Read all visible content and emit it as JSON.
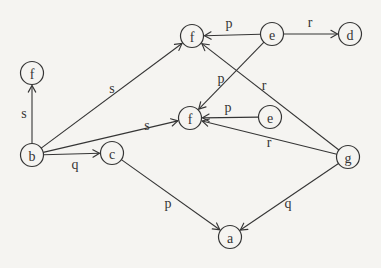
{
  "page": {
    "background_color": "#f5f4f1",
    "ink_color": "#353535"
  },
  "diagram": {
    "type": "directed-graph",
    "node_radius": 11.5,
    "nodes": [
      {
        "id": "f-top",
        "label": "f",
        "x": 192,
        "y": 36
      },
      {
        "id": "e-top",
        "label": "e",
        "x": 272,
        "y": 34
      },
      {
        "id": "d",
        "label": "d",
        "x": 350,
        "y": 34
      },
      {
        "id": "f-left",
        "label": "f",
        "x": 32,
        "y": 73
      },
      {
        "id": "f-mid",
        "label": "f",
        "x": 190,
        "y": 118
      },
      {
        "id": "e-mid",
        "label": "e",
        "x": 270,
        "y": 117
      },
      {
        "id": "b",
        "label": "b",
        "x": 32,
        "y": 155
      },
      {
        "id": "c",
        "label": "c",
        "x": 112,
        "y": 153
      },
      {
        "id": "g",
        "label": "g",
        "x": 348,
        "y": 157
      },
      {
        "id": "a",
        "label": "a",
        "x": 230,
        "y": 237
      }
    ],
    "edges": [
      {
        "from": "b",
        "to": "f-left",
        "label": "s",
        "label_x": 24,
        "label_y": 113
      },
      {
        "from": "b",
        "to": "f-top",
        "label": "s",
        "label_x": 112,
        "label_y": 88
      },
      {
        "from": "b",
        "to": "f-mid",
        "label": "s",
        "label_x": 147,
        "label_y": 125
      },
      {
        "from": "b",
        "to": "c",
        "label": "q",
        "label_x": 75,
        "label_y": 164
      },
      {
        "from": "e-top",
        "to": "f-top",
        "label": "p",
        "label_x": 229,
        "label_y": 23
      },
      {
        "from": "e-top",
        "to": "d",
        "label": "r",
        "label_x": 310,
        "label_y": 22
      },
      {
        "from": "e-top",
        "to": "f-mid",
        "label": "p",
        "label_x": 221,
        "label_y": 78
      },
      {
        "from": "e-mid",
        "to": "f-mid",
        "label": "p",
        "label_x": 228,
        "label_y": 107
      },
      {
        "from": "g",
        "to": "f-top",
        "label": "r",
        "label_x": 264,
        "label_y": 85
      },
      {
        "from": "g",
        "to": "f-mid",
        "label": "r",
        "label_x": 269,
        "label_y": 142
      },
      {
        "from": "c",
        "to": "a",
        "label": "p",
        "label_x": 168,
        "label_y": 203
      },
      {
        "from": "g",
        "to": "a",
        "label": "q",
        "label_x": 288,
        "label_y": 203
      }
    ]
  }
}
